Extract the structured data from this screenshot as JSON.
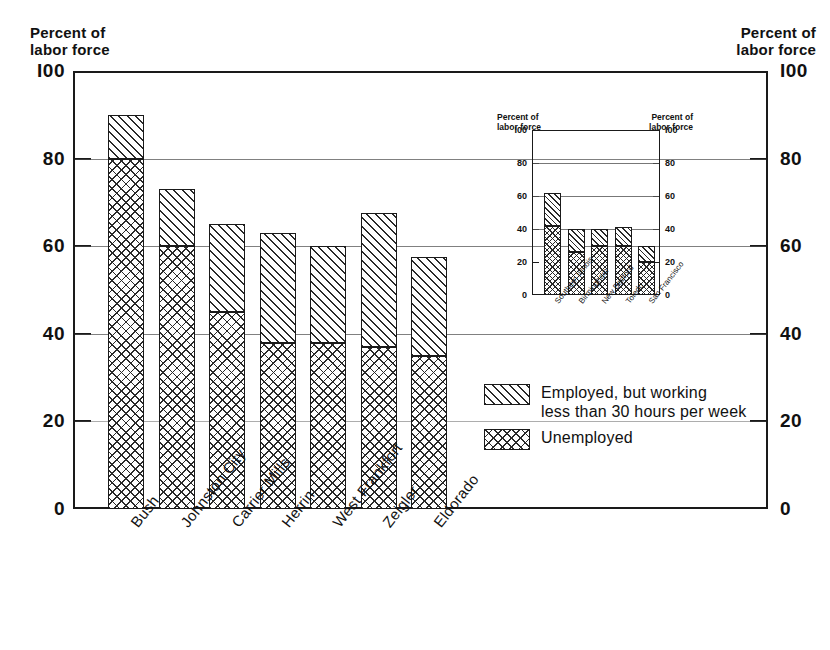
{
  "axis_caption_left": "Percent of\nlabor force",
  "axis_caption_right": "Percent of\nlabor force",
  "legend": {
    "items": [
      {
        "pattern": "diagonal-hatch",
        "label": "Employed, but working\nless than 30 hours per week"
      },
      {
        "pattern": "cross-hatch",
        "label": "Unemployed"
      }
    ]
  },
  "chart_data": [
    {
      "id": "main",
      "type": "bar",
      "stacked": true,
      "title": "",
      "xlabel": "",
      "ylabel": "Percent of labor force",
      "ylim": [
        0,
        100
      ],
      "yticks": [
        0,
        20,
        40,
        60,
        80,
        100
      ],
      "grid": true,
      "legend_position": "inside-right",
      "categories": [
        "Bush",
        "Johnston City",
        "Carrier Mills",
        "Herrin",
        "West Frankfort",
        "Zeigler",
        "Eldorado"
      ],
      "series": [
        {
          "name": "Unemployed",
          "pattern": "cross-hatch",
          "values": [
            80,
            60,
            45,
            38,
            38,
            37,
            35
          ]
        },
        {
          "name": "Employed, but working less than 30 hours per week",
          "pattern": "diagonal-hatch",
          "values": [
            10,
            13,
            20,
            25,
            22,
            30.5,
            22.5
          ]
        }
      ],
      "totals": [
        90,
        73,
        65,
        63,
        60,
        67.5,
        57.5
      ]
    },
    {
      "id": "inset",
      "type": "bar",
      "stacked": true,
      "title": "",
      "xlabel": "",
      "ylabel": "Percent of labor force",
      "ylim": [
        0,
        100
      ],
      "yticks": [
        0,
        20,
        40,
        60,
        80,
        100
      ],
      "grid": true,
      "caption_left": "Percent of\nlabor force",
      "caption_right": "Percent of\nlabor force",
      "categories": [
        "Southern Illinois",
        "Birmingham",
        "New Bedford",
        "Toledo",
        "San Francisco"
      ],
      "series": [
        {
          "name": "Unemployed",
          "pattern": "cross-hatch",
          "values": [
            42,
            26,
            30,
            30,
            20
          ]
        },
        {
          "name": "Employed, but working less than 30 hours per week",
          "pattern": "diagonal-hatch",
          "values": [
            20,
            14,
            10,
            11,
            10
          ]
        }
      ],
      "totals": [
        62,
        40,
        40,
        41,
        30
      ]
    }
  ]
}
